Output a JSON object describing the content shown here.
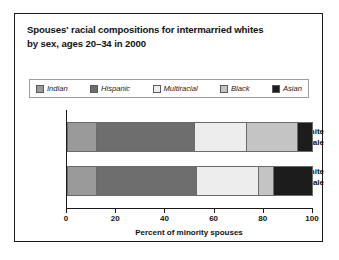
{
  "chart_data": {
    "type": "bar",
    "orientation": "horizontal",
    "stacked": true,
    "title": "Spouses' racial compositions for intermarried whites by sex, ages 20–34 in 2000",
    "title_lines": [
      "Spouses' racial compositions for intermarried whites",
      "by sex, ages 20–34 in 2000"
    ],
    "xlabel": "Percent of minority spouses",
    "ylabel": "",
    "xlim": [
      0,
      100
    ],
    "xticks": [
      0,
      20,
      40,
      60,
      80,
      100
    ],
    "xtick_labels": [
      "0",
      "20",
      "40",
      "60",
      "80",
      "100"
    ],
    "grid": false,
    "legend_position": "top",
    "categories": [
      "White female",
      "White male"
    ],
    "series": [
      {
        "name": "Indian",
        "color": "#9a9a9a",
        "values": [
          12,
          12
        ]
      },
      {
        "name": "Hispanic",
        "color": "#6e6e6e",
        "values": [
          40,
          41
        ]
      },
      {
        "name": "Multiracial",
        "color": "#ededed",
        "values": [
          21,
          25
        ]
      },
      {
        "name": "Black",
        "color": "#c4c4c4",
        "values": [
          21,
          6
        ]
      },
      {
        "name": "Asian",
        "color": "#1c1c1c",
        "values": [
          6,
          16
        ]
      }
    ]
  },
  "legend": {
    "items": [
      {
        "label": "Indian",
        "color": "#9a9a9a"
      },
      {
        "label": "Hispanic",
        "color": "#6e6e6e"
      },
      {
        "label": "Multiracial",
        "color": "#ededed"
      },
      {
        "label": "Black",
        "color": "#c4c4c4"
      },
      {
        "label": "Asian",
        "color": "#1c1c1c"
      }
    ]
  },
  "category_labels": {
    "female": [
      "White",
      "female"
    ],
    "male": [
      "White",
      "male"
    ]
  }
}
